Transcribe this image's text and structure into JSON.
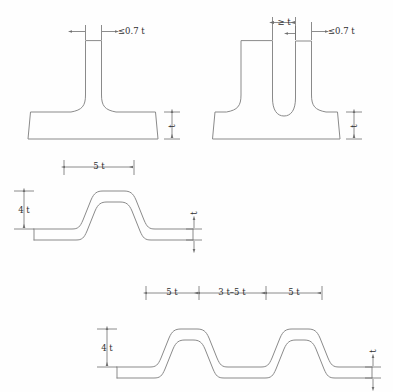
{
  "diagram": {
    "background_color": "#fefefe",
    "line_color": "#8a8a8a",
    "dimension_color": "#6f6f6f",
    "text_color": "#2e2e2e"
  },
  "figures": [
    {
      "id": "fig-tee-single",
      "name": "single-web-tee-section",
      "position": "top-left",
      "dimensions": [
        {
          "key": "web_thickness",
          "label": "≤0.7 t",
          "orientation": "horizontal",
          "location": "top-web"
        },
        {
          "key": "flange_thickness",
          "label": "t",
          "orientation": "vertical",
          "location": "right-flange"
        }
      ]
    },
    {
      "id": "fig-tee-double",
      "name": "double-web-tee-section",
      "position": "top-right",
      "dimensions": [
        {
          "key": "web_gap",
          "label": "≥ t",
          "orientation": "horizontal",
          "location": "top-between-webs"
        },
        {
          "key": "web_thickness",
          "label": "≤0.7 t",
          "orientation": "horizontal",
          "location": "top-right-web"
        },
        {
          "key": "flange_thickness",
          "label": "t",
          "orientation": "vertical",
          "location": "right-flange"
        }
      ]
    },
    {
      "id": "fig-hat-single",
      "name": "single-hat-section",
      "position": "middle-left",
      "dimensions": [
        {
          "key": "crown_width",
          "label": "5 t",
          "orientation": "horizontal",
          "location": "top-crown"
        },
        {
          "key": "height",
          "label": "4 t",
          "orientation": "vertical",
          "location": "left-side"
        },
        {
          "key": "sheet_thickness",
          "label": "t",
          "orientation": "vertical",
          "location": "right-flange"
        }
      ]
    },
    {
      "id": "fig-hat-double",
      "name": "double-hat-section",
      "position": "bottom",
      "dimensions": [
        {
          "key": "crown_width_left",
          "label": "5 t",
          "orientation": "horizontal",
          "location": "top-left-crown"
        },
        {
          "key": "crown_spacing",
          "label": "3 t–5 t",
          "orientation": "horizontal",
          "location": "top-between-crowns"
        },
        {
          "key": "crown_width_right",
          "label": "5 t",
          "orientation": "horizontal",
          "location": "top-right-crown"
        },
        {
          "key": "height",
          "label": "4 t",
          "orientation": "vertical",
          "location": "left-side"
        },
        {
          "key": "sheet_thickness",
          "label": "t",
          "orientation": "vertical",
          "location": "right-flange"
        }
      ]
    }
  ],
  "labels": {
    "le_07t_a": "≤0.7 t",
    "le_07t_b": "≤0.7 t",
    "ge_t": "≥ t",
    "t_fig1": "t",
    "t_fig2": "t",
    "t_fig3": "t",
    "t_fig4": "t",
    "five_t_fig3": "5 t",
    "four_t_fig3": "4 t",
    "five_t_left": "5 t",
    "three_to_five_t": "3 t–5 t",
    "five_t_right": "5 t",
    "four_t_fig4": "4 t"
  }
}
